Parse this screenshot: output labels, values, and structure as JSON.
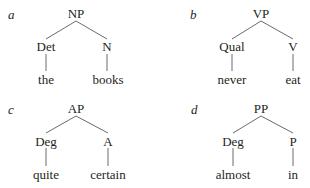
{
  "figure": {
    "panels": [
      {
        "letter": "a",
        "root": "NP",
        "children": [
          {
            "category": "Det",
            "word": "the"
          },
          {
            "category": "N",
            "word": "books"
          }
        ]
      },
      {
        "letter": "b",
        "root": "VP",
        "children": [
          {
            "category": "Qual",
            "word": "never"
          },
          {
            "category": "V",
            "word": "eat"
          }
        ]
      },
      {
        "letter": "c",
        "root": "AP",
        "children": [
          {
            "category": "Deg",
            "word": "quite"
          },
          {
            "category": "A",
            "word": "certain"
          }
        ]
      },
      {
        "letter": "d",
        "root": "PP",
        "children": [
          {
            "category": "Deg",
            "word": "almost"
          },
          {
            "category": "P",
            "word": "in"
          }
        ]
      }
    ]
  }
}
